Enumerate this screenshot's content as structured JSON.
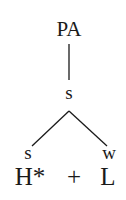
{
  "tree": {
    "root": {
      "label": "PA"
    },
    "node": {
      "label": "s"
    },
    "children": [
      {
        "label": "s"
      },
      {
        "label": "w"
      }
    ]
  },
  "tones": {
    "left": "H*",
    "operator": "+",
    "right": "L"
  },
  "colors": {
    "ink": "#1a1a1a",
    "background": "#ffffff"
  }
}
